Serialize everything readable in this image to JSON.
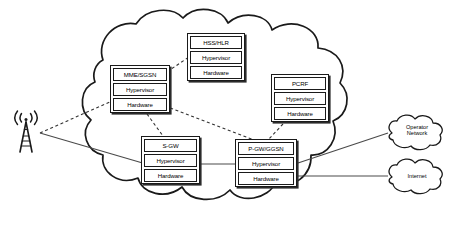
{
  "diagram": {
    "type": "network-architecture",
    "canvas": {
      "width": 453,
      "height": 233
    },
    "colors": {
      "background": "#ffffff",
      "stroke": "#1a1a1a",
      "box_shadow": "#2b2b2b",
      "text": "#000000",
      "connector_solid": "#333333",
      "connector_dashed": "#333333"
    }
  },
  "main_cloud": {
    "name": "operator-data-center-cloud",
    "label": ""
  },
  "nf_boxes": [
    {
      "id": "hss-hlr",
      "rows": [
        "HSS/HLR",
        "Hypervisor",
        "Hardware"
      ],
      "x": 187,
      "y": 33,
      "w": 58,
      "h": 48
    },
    {
      "id": "mme-sgsn",
      "rows": [
        "MME/SGSN",
        "Hypervisor",
        "Hardware"
      ],
      "x": 110,
      "y": 65,
      "w": 60,
      "h": 48
    },
    {
      "id": "pcrf",
      "rows": [
        "PCRF",
        "Hypervisor",
        "Hardware"
      ],
      "x": 271,
      "y": 74,
      "w": 58,
      "h": 48
    },
    {
      "id": "s-gw",
      "rows": [
        "S-GW",
        "Hypervisor",
        "Hardware"
      ],
      "x": 141,
      "y": 136,
      "w": 59,
      "h": 48
    },
    {
      "id": "p-gw-ggsn",
      "rows": [
        "P-GW/GGSN",
        "Hypervisor",
        "Hardware"
      ],
      "x": 235,
      "y": 139,
      "w": 62,
      "h": 48
    }
  ],
  "external_clouds": [
    {
      "id": "operator-network",
      "label": "Operator\nNetwork",
      "x": 382,
      "y": 116,
      "w": 66,
      "h": 34
    },
    {
      "id": "internet",
      "label": "Internet",
      "x": 382,
      "y": 161,
      "w": 66,
      "h": 32
    }
  ],
  "base_station": {
    "id": "cell-tower",
    "label": "",
    "x": 12,
    "y": 110,
    "w": 30,
    "h": 44
  },
  "connections": [
    {
      "id": "tower-to-mme",
      "style": "dashed",
      "from": "cell-tower",
      "to": "mme-sgsn"
    },
    {
      "id": "tower-to-sgw",
      "style": "solid",
      "from": "cell-tower",
      "to": "s-gw"
    },
    {
      "id": "mme-to-hss",
      "style": "dashed",
      "from": "mme-sgsn",
      "to": "hss-hlr"
    },
    {
      "id": "mme-to-sgw",
      "style": "dashed",
      "from": "mme-sgsn",
      "to": "s-gw"
    },
    {
      "id": "mme-to-pgw",
      "style": "dashed",
      "from": "mme-sgsn",
      "to": "p-gw-ggsn"
    },
    {
      "id": "pcrf-to-pgw",
      "style": "dashed",
      "from": "pcrf",
      "to": "p-gw-ggsn"
    },
    {
      "id": "sgw-to-pgw",
      "style": "solid",
      "from": "s-gw",
      "to": "p-gw-ggsn"
    },
    {
      "id": "pgw-to-operator-network",
      "style": "solid",
      "from": "p-gw-ggsn",
      "to": "operator-network"
    },
    {
      "id": "pgw-to-internet",
      "style": "solid",
      "from": "p-gw-ggsn",
      "to": "internet"
    }
  ]
}
